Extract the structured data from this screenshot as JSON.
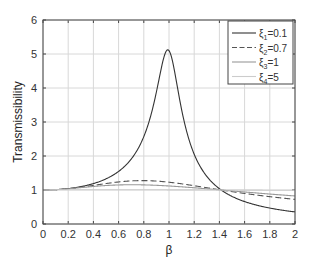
{
  "chart_data": {
    "type": "line",
    "title": "",
    "xlabel": "β",
    "ylabel": "Transmissibility",
    "xlim": [
      0,
      2
    ],
    "ylim": [
      0,
      6
    ],
    "xticks": [
      "0",
      "0.2",
      "0.4",
      "0.6",
      "0.8",
      "1",
      "1.2",
      "1.4",
      "1.6",
      "1.8",
      "2"
    ],
    "yticks": [
      "0",
      "1",
      "2",
      "3",
      "4",
      "5",
      "6"
    ],
    "grid": true,
    "legend_position": "upper right",
    "x": [
      0,
      0.2,
      0.4,
      0.6,
      0.8,
      0.9,
      1.0,
      1.1,
      1.2,
      1.4,
      1.6,
      1.8,
      2.0
    ],
    "series": [
      {
        "name": "ξ1=0.1",
        "label_main": "ξ",
        "label_sub": "1",
        "label_val": "=0.1",
        "style": "solid",
        "color": "#333333",
        "values": [
          1.0,
          1.04,
          1.19,
          1.55,
          2.7,
          4.4,
          5.1,
          3.8,
          2.0,
          0.98,
          0.65,
          0.46,
          0.35
        ]
      },
      {
        "name": "ξ2=0.7",
        "label_main": "ξ",
        "label_sub": "2",
        "label_val": "=0.7",
        "style": "dashed",
        "color": "#555555",
        "values": [
          1.0,
          1.02,
          1.1,
          1.2,
          1.25,
          1.24,
          1.22,
          1.17,
          1.12,
          1.0,
          0.88,
          0.8,
          0.72
        ]
      },
      {
        "name": "ξ3=1",
        "label_main": "ξ",
        "label_sub": "3",
        "label_val": "=1",
        "style": "solid",
        "color": "#999999",
        "values": [
          1.0,
          1.01,
          1.05,
          1.1,
          1.12,
          1.12,
          1.12,
          1.1,
          1.07,
          1.0,
          0.93,
          0.87,
          0.82
        ]
      },
      {
        "name": "ξ4=5",
        "label_main": "ξ",
        "label_sub": "4",
        "label_val": "=5",
        "style": "solid",
        "color": "#cccccc",
        "values": [
          1.0,
          1.0,
          1.0,
          1.0,
          1.0,
          1.0,
          1.0,
          1.0,
          1.0,
          1.0,
          0.99,
          0.99,
          0.98
        ]
      }
    ],
    "zetas": [
      0.1,
      0.7,
      1,
      5
    ]
  }
}
